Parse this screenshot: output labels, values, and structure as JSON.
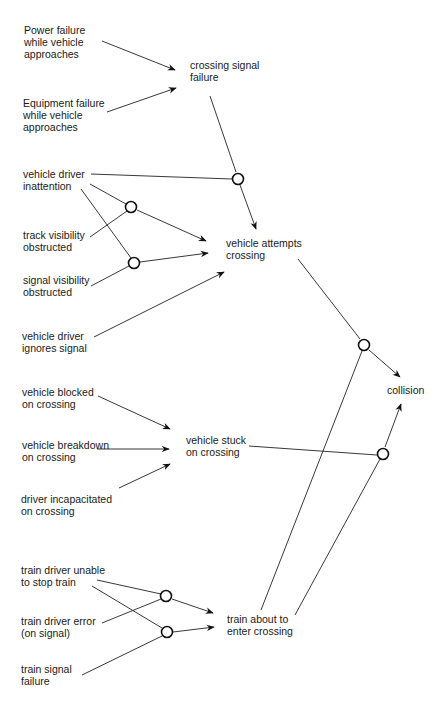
{
  "diagram": {
    "type": "cause-consequence / fault tree",
    "nodes": {
      "power_failure": "Power failure\nwhile vehicle\napproaches",
      "equipment_failure": "Equipment failure\nwhile vehicle\napproaches",
      "crossing_signal_failure": "crossing signal\nfailure",
      "driver_inattention": "vehicle driver\ninattention",
      "track_visibility": "track visibility\nobstructed",
      "signal_visibility": "signal visibility\nobstructed",
      "driver_ignores": "vehicle driver\nignores signal",
      "vehicle_attempts": "vehicle attempts\ncrossing",
      "collision": "collision",
      "vehicle_blocked": "vehicle blocked\non crossing",
      "vehicle_breakdown": "vehicle breakdown\non crossing",
      "driver_incapacitated": "driver incapacitated\non crossing",
      "vehicle_stuck": "vehicle stuck\non crossing",
      "train_unable_stop": "train driver unable\nto stop train",
      "train_driver_error": "train driver error\n(on signal)",
      "train_signal_failure": "train signal\nfailure",
      "train_about_enter": "train about to\nenter crossing"
    },
    "gates": [
      {
        "id": "g1",
        "type": "AND",
        "inputs": [
          "crossing_signal_failure",
          "driver_inattention"
        ],
        "output": "vehicle_attempts"
      },
      {
        "id": "g2",
        "type": "AND",
        "inputs": [
          "driver_inattention",
          "track_visibility"
        ],
        "output": "vehicle_attempts"
      },
      {
        "id": "g3",
        "type": "AND",
        "inputs": [
          "driver_inattention",
          "signal_visibility"
        ],
        "output": "vehicle_attempts"
      },
      {
        "id": "g4",
        "type": "AND",
        "inputs": [
          "vehicle_attempts",
          "train_about_enter"
        ],
        "output": "collision"
      },
      {
        "id": "g5",
        "type": "AND",
        "inputs": [
          "vehicle_stuck",
          "train_about_enter"
        ],
        "output": "collision"
      },
      {
        "id": "g6",
        "type": "AND",
        "inputs": [
          "train_unable_stop",
          "train_driver_error"
        ],
        "output": "train_about_enter"
      },
      {
        "id": "g7",
        "type": "AND",
        "inputs": [
          "train_unable_stop",
          "train_signal_failure"
        ],
        "output": "train_about_enter"
      }
    ],
    "direct_edges": [
      [
        "power_failure",
        "crossing_signal_failure"
      ],
      [
        "equipment_failure",
        "crossing_signal_failure"
      ],
      [
        "driver_ignores",
        "vehicle_attempts"
      ],
      [
        "vehicle_blocked",
        "vehicle_stuck"
      ],
      [
        "vehicle_breakdown",
        "vehicle_stuck"
      ],
      [
        "driver_incapacitated",
        "vehicle_stuck"
      ]
    ]
  }
}
